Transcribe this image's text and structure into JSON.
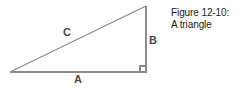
{
  "figure": {
    "caption_line_1": "Figure 12-10:",
    "caption_line_2": "A triangle",
    "background_color": "#ffffff",
    "line_color": "#8a8a8a",
    "label_color": "#4a4a4a",
    "caption_color": "#1a1a1a"
  },
  "diagram": {
    "type": "right-triangle",
    "labels": {
      "hypotenuse": "C",
      "vertical_leg": "B",
      "horizontal_leg": "A"
    },
    "vertices": {
      "left": [
        10,
        72
      ],
      "bottom_right": [
        146,
        72
      ],
      "top_right": [
        146,
        6
      ]
    },
    "right_angle_marker": {
      "at": "bottom_right",
      "size": 6
    }
  }
}
